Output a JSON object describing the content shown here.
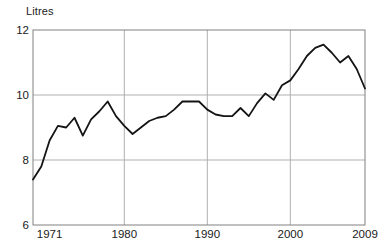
{
  "chart_data": {
    "type": "line",
    "title": "",
    "subtitle": "",
    "xlabel": "",
    "ylabel": "Litres",
    "ylabel_position": "top-left",
    "xlim": [
      1969,
      2009
    ],
    "ylim": [
      6,
      12
    ],
    "yticks": [
      6,
      8,
      10,
      12
    ],
    "ytick_labels": [
      "6",
      "8",
      "10",
      "12"
    ],
    "xticks": [
      1971,
      1980,
      1990,
      2000,
      2009
    ],
    "xtick_labels": [
      "1971",
      "1980",
      "1990",
      "2000",
      "2009"
    ],
    "gridlines": {
      "horizontal_at": [
        8,
        10
      ],
      "vertical_at": [
        1980,
        1990,
        2000
      ],
      "color": "#b0b0b0",
      "enabled": true
    },
    "axis_frame_color": "#808080",
    "legend": null,
    "legend_position": "none",
    "annotations": [],
    "series": [
      {
        "name": "Litres per head",
        "color": "#141414",
        "line_width": 1.8,
        "x": [
          1969,
          1970,
          1971,
          1972,
          1973,
          1974,
          1975,
          1976,
          1977,
          1978,
          1979,
          1980,
          1981,
          1982,
          1983,
          1984,
          1985,
          1986,
          1987,
          1988,
          1989,
          1990,
          1991,
          1992,
          1993,
          1994,
          1995,
          1996,
          1997,
          1998,
          1999,
          2000,
          2001,
          2002,
          2003,
          2004,
          2005,
          2006,
          2007,
          2008,
          2009
        ],
        "values": [
          7.4,
          7.8,
          8.6,
          9.05,
          9.0,
          9.3,
          8.75,
          9.25,
          9.5,
          9.8,
          9.35,
          9.05,
          8.8,
          9.0,
          9.2,
          9.3,
          9.35,
          9.55,
          9.8,
          9.8,
          9.8,
          9.55,
          9.4,
          9.35,
          9.35,
          9.6,
          9.35,
          9.75,
          10.05,
          9.85,
          10.3,
          10.45,
          10.8,
          11.2,
          11.45,
          11.55,
          11.3,
          11.0,
          11.2,
          10.8,
          10.2
        ]
      }
    ]
  }
}
